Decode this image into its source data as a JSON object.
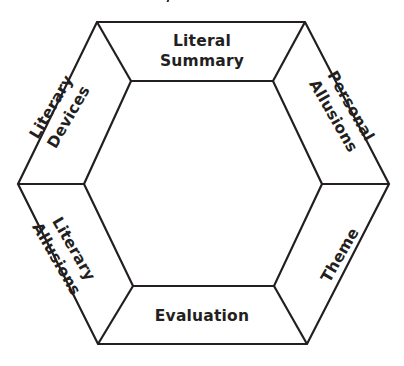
{
  "diagram": {
    "type": "hexagonal-ring",
    "segments": [
      {
        "id": "top",
        "lines": [
          "Literal",
          "Summary"
        ]
      },
      {
        "id": "upper-right",
        "lines": [
          "Personal",
          "Allusions"
        ]
      },
      {
        "id": "lower-right",
        "lines": [
          "Theme"
        ]
      },
      {
        "id": "bottom",
        "lines": [
          "Evaluation"
        ]
      },
      {
        "id": "lower-left",
        "lines": [
          "Literary",
          "Allusions"
        ]
      },
      {
        "id": "upper-left",
        "lines": [
          "Literary",
          "Devices"
        ]
      }
    ],
    "colors": {
      "stroke": "#231f20",
      "text": "#231f20",
      "background": "#ffffff"
    }
  }
}
